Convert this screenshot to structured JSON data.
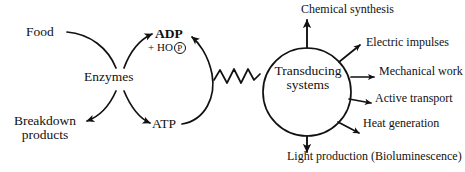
{
  "figure": {
    "background_color": "#ffffff",
    "ink_color": "#111111"
  },
  "left_cycle": {
    "input_label": "Food",
    "catalyst_label": "Enzymes",
    "waste_label": "Breakdown\nproducts",
    "waste_line1": "Breakdown",
    "waste_line2": "products",
    "adp_label": "ADP",
    "phosphate_prefix": "+ HO",
    "phosphate_symbol": "P",
    "atp_label": "ATP"
  },
  "coupling": {
    "symbol": "squiggle-high-energy-bond"
  },
  "right_cycle": {
    "hub_line1": "Transducing",
    "hub_line2": "systems",
    "outputs": [
      {
        "label": "Chemical synthesis",
        "direction": "up"
      },
      {
        "label": "Electric impulses",
        "direction": "up-right"
      },
      {
        "label": "Mechanical work",
        "direction": "right"
      },
      {
        "label": "Active transport",
        "direction": "right-down"
      },
      {
        "label": "Heat generation",
        "direction": "down-right"
      },
      {
        "label": "Light production (Bioluminescence)",
        "direction": "down"
      }
    ]
  }
}
